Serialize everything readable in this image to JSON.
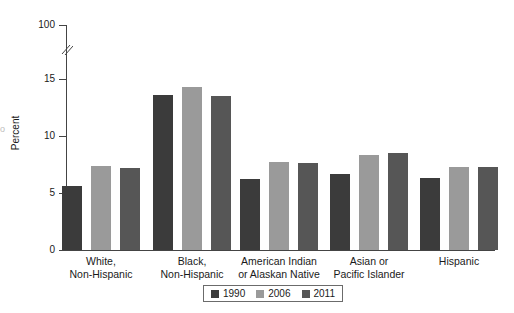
{
  "chart_data": {
    "type": "bar",
    "title": "",
    "subtitle": "",
    "xlabel": "",
    "ylabel": "Percent",
    "categories": [
      "White,\nNon-Hispanic",
      "Black,\nNon-Hispanic",
      "American Indian\nor Alaskan Native",
      "Asian or\nPacific Islander",
      "Hispanic"
    ],
    "category_lines": [
      [
        "White,",
        "Non-Hispanic"
      ],
      [
        "Black,",
        "Non-Hispanic"
      ],
      [
        "American Indian",
        "or Alaskan Native"
      ],
      [
        "Asian or",
        "Pacific Islander"
      ],
      [
        "Hispanic"
      ]
    ],
    "series": [
      {
        "name": "1990",
        "color": "#3b3b3b",
        "values": [
          5.6,
          13.6,
          6.2,
          6.7,
          6.3
        ]
      },
      {
        "name": "2006",
        "color": "#9a9a9a",
        "values": [
          7.4,
          14.3,
          7.7,
          8.3,
          7.3
        ]
      },
      {
        "name": "2011",
        "color": "#565656",
        "values": [
          7.2,
          13.5,
          7.6,
          8.5,
          7.3
        ]
      }
    ],
    "ytick_labels": [
      "0",
      "5",
      "10",
      "15",
      "100"
    ],
    "ytick_values": [
      0,
      5,
      10,
      15,
      100
    ],
    "ylim": [
      0,
      100
    ],
    "axis_break": true,
    "axis_break_between": [
      15,
      100
    ],
    "grid": false,
    "legend_position": "bottom-center",
    "legend_entries": [
      "1990",
      "2006",
      "2011"
    ]
  },
  "legend": {
    "items": [
      {
        "label": "1990",
        "color": "#3b3b3b"
      },
      {
        "label": "2006",
        "color": "#9a9a9a"
      },
      {
        "label": "2011",
        "color": "#565656"
      }
    ]
  },
  "axis": {
    "y_title": "Percent",
    "ticks": [
      {
        "label": "100",
        "value": 100
      },
      {
        "label": "15",
        "value": 15
      },
      {
        "label": "10",
        "value": 10
      },
      {
        "label": "5",
        "value": 5
      },
      {
        "label": "0",
        "value": 0
      }
    ]
  },
  "edge": {
    "artifact": "o"
  },
  "colors": {
    "series_1990": "#3b3b3b",
    "series_2006": "#9a9a9a",
    "series_2011": "#565656",
    "axis": "#444444",
    "text": "#1a1a1a",
    "background": "#ffffff"
  }
}
